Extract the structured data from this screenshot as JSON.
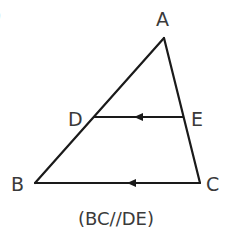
{
  "diagram": {
    "type": "triangle-with-parallel-segment",
    "partial_label_top_left": ")",
    "vertices": {
      "A": {
        "label": "A",
        "x": 164,
        "y": 38
      },
      "B": {
        "label": "B",
        "x": 35,
        "y": 183
      },
      "C": {
        "label": "C",
        "x": 200,
        "y": 183
      },
      "D": {
        "label": "D",
        "x": 94,
        "y": 117
      },
      "E": {
        "label": "E",
        "x": 183,
        "y": 117
      }
    },
    "segments": [
      {
        "from": "A",
        "to": "B"
      },
      {
        "from": "A",
        "to": "C"
      },
      {
        "from": "B",
        "to": "C",
        "arrow": "left",
        "arrow_x": 130
      },
      {
        "from": "D",
        "to": "E",
        "arrow": "left",
        "arrow_x": 140
      }
    ],
    "caption": "(BC//DE)",
    "colors": {
      "line": "#1a1a1a",
      "text": "#3a3a3a",
      "background": "#ffffff"
    }
  }
}
